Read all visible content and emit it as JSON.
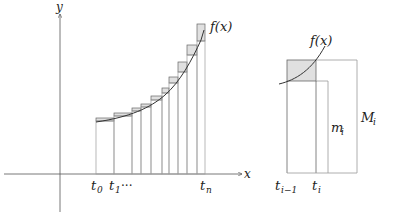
{
  "left_diagram": {
    "axis_labels": {
      "x": "x",
      "y": "y"
    },
    "curve_label": "f(x)",
    "tick_labels": {
      "t0": {
        "base": "t",
        "sub": "0"
      },
      "t1": {
        "base": "t",
        "sub": "1"
      },
      "dots": "···",
      "tn": {
        "base": "t",
        "sub": "n"
      }
    },
    "partition_x": [
      96,
      114,
      132,
      141,
      151,
      162,
      169,
      178,
      187,
      197,
      205
    ],
    "lower_y": [
      121,
      116,
      111,
      107,
      100,
      93,
      83,
      72,
      55,
      41
    ],
    "upper_y": [
      118,
      113,
      108,
      104,
      96,
      88,
      77,
      62,
      45,
      24
    ]
  },
  "right_diagram": {
    "curve_label": "f(x)",
    "left_label": {
      "base": "t",
      "sub": "i−1"
    },
    "right_label": {
      "base": "t",
      "sub": "i"
    },
    "lower_label": {
      "base": "m",
      "sub": "i"
    },
    "upper_label": {
      "base": "M",
      "sub": "i"
    }
  },
  "colors": {
    "line": "#555555",
    "light_line": "#9a9a9a",
    "fill": "#e0e0e0",
    "curve": "#333333"
  }
}
